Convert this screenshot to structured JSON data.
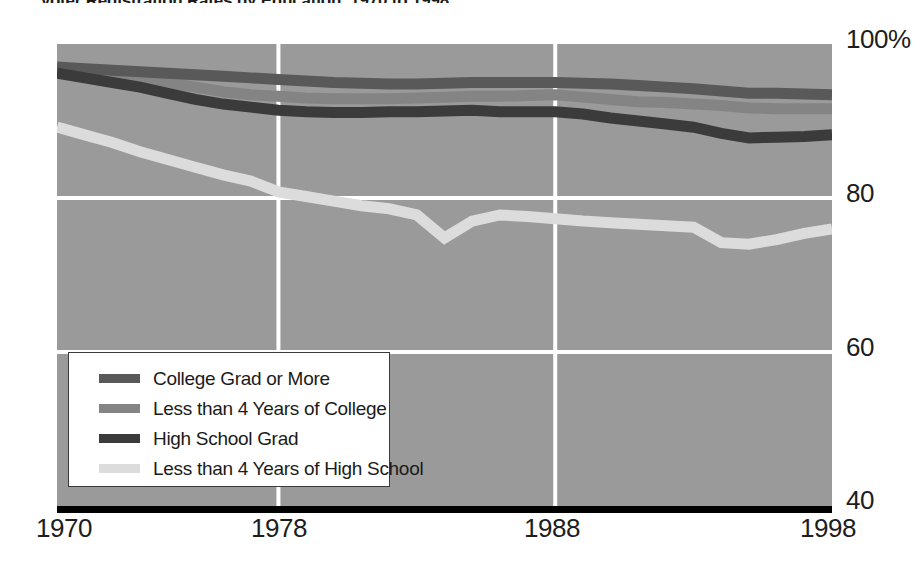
{
  "chart_title": "Voter Registration Rates by Education, 1970 to 1998",
  "axes": {
    "y_ticks": [
      "100%",
      "80",
      "60",
      "40"
    ],
    "x_ticks": [
      "1970",
      "1978",
      "1988",
      "1998"
    ]
  },
  "legend": {
    "items": [
      {
        "label": "College Grad or More",
        "color": "#595959",
        "key": "college_grad_or_more"
      },
      {
        "label": "Less than 4 Years of College",
        "color": "#848484",
        "key": "less_than_4_years_college"
      },
      {
        "label": "High School Grad",
        "color": "#3b3b3b",
        "key": "high_school_grad"
      },
      {
        "label": "Less than 4 Years of High School",
        "color": "#dcdcdc",
        "key": "less_than_4_years_high_school"
      }
    ]
  },
  "colors": {
    "plot_background": "#9a9a9a",
    "gridline": "#ffffff",
    "axis_line": "#000000",
    "text": "#1d1d1d",
    "legend_background": "#ffffff",
    "legend_border": "#3a3a3a"
  },
  "chart_data": {
    "type": "line",
    "title": "Voter Registration Rates by Education, 1970 to 1998",
    "xlabel": "",
    "ylabel": "",
    "xlim": [
      1970,
      1998
    ],
    "ylim": [
      40,
      100
    ],
    "grid": true,
    "legend_position": "inside-lower-left",
    "x": [
      1970,
      1971,
      1972,
      1973,
      1974,
      1975,
      1976,
      1977,
      1978,
      1979,
      1980,
      1981,
      1982,
      1983,
      1984,
      1985,
      1986,
      1987,
      1988,
      1989,
      1990,
      1991,
      1992,
      1993,
      1994,
      1995,
      1996,
      1997,
      1998
    ],
    "xticks": [
      1970,
      1978,
      1988,
      1998
    ],
    "yticks": [
      40,
      60,
      80,
      100
    ],
    "ytick_labels": [
      "40",
      "60",
      "80",
      "100%"
    ],
    "series": [
      {
        "name": "College Grad or More",
        "color": "#595959",
        "values": [
          97.0,
          96.8,
          96.6,
          96.4,
          96.2,
          96.0,
          95.8,
          95.6,
          95.4,
          95.2,
          95.0,
          94.9,
          94.8,
          94.8,
          94.9,
          95.0,
          95.0,
          95.0,
          95.0,
          94.9,
          94.8,
          94.6,
          94.4,
          94.2,
          93.9,
          93.6,
          93.6,
          93.5,
          93.4
        ]
      },
      {
        "name": "Less than 4 Years of College",
        "color": "#848484",
        "values": [
          96.6,
          96.2,
          95.8,
          95.4,
          95.0,
          94.4,
          93.8,
          93.4,
          93.2,
          93.0,
          92.9,
          92.9,
          92.9,
          93.0,
          93.1,
          93.2,
          93.2,
          93.3,
          93.4,
          93.1,
          92.8,
          92.5,
          92.4,
          92.2,
          92.0,
          91.7,
          91.6,
          91.6,
          91.6
        ]
      },
      {
        "name": "High School Grad",
        "color": "#3b3b3b",
        "values": [
          96.2,
          95.6,
          95.0,
          94.4,
          93.6,
          92.8,
          92.2,
          91.8,
          91.4,
          91.2,
          91.1,
          91.1,
          91.2,
          91.2,
          91.3,
          91.4,
          91.2,
          91.2,
          91.2,
          90.9,
          90.4,
          90.0,
          89.6,
          89.2,
          88.4,
          87.8,
          87.9,
          88.0,
          88.2
        ]
      },
      {
        "name": "Less than 4 Years of High School",
        "color": "#dcdcdc",
        "values": [
          89.2,
          88.2,
          87.2,
          86.0,
          85.0,
          84.0,
          83.0,
          82.2,
          80.8,
          80.2,
          79.6,
          79.0,
          78.6,
          77.8,
          74.8,
          77.0,
          77.8,
          77.6,
          77.3,
          77.0,
          76.8,
          76.6,
          76.4,
          76.2,
          74.2,
          74.0,
          74.6,
          75.4,
          76.0
        ]
      }
    ]
  }
}
